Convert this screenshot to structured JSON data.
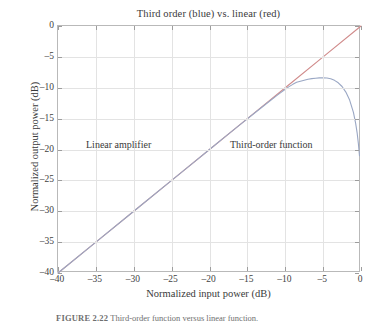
{
  "figure": {
    "caption_label": "FIGURE 2.22",
    "caption_text": "Third-order function versus linear function."
  },
  "chart_data": {
    "type": "line",
    "title": "Third order (blue) vs. linear (red)",
    "xlabel": "Normalized input power (dB)",
    "ylabel": "Normalized output power (dB)",
    "xlim": [
      -40,
      0
    ],
    "ylim": [
      -40,
      0
    ],
    "xticks": [
      -40,
      -35,
      -30,
      -25,
      -20,
      -15,
      -10,
      -5,
      0
    ],
    "yticks": [
      0,
      -5,
      -10,
      -15,
      -20,
      -25,
      -30,
      -35,
      -40
    ],
    "xticklabels": [
      "–40",
      "–35",
      "–30",
      "–25",
      "–20",
      "–15",
      "–10",
      "–5",
      "0"
    ],
    "yticklabels": [
      "0",
      "–5",
      "–10",
      "–15",
      "–20",
      "–25",
      "–30",
      "–35",
      "–40"
    ],
    "grid": true,
    "legend": "none",
    "annotations": [
      {
        "text": "Linear amplifier",
        "x": -32.0,
        "y": -18.5
      },
      {
        "text": "Third-order function",
        "x": -12.5,
        "y": -18.5
      }
    ],
    "series": [
      {
        "name": "linear (red)",
        "color": "#d08a8a",
        "x": [
          -40,
          -35,
          -30,
          -25,
          -20,
          -15,
          -10,
          -5,
          0
        ],
        "y": [
          -40,
          -35,
          -30,
          -25,
          -20,
          -15,
          -10,
          -5,
          0
        ]
      },
      {
        "name": "third order (blue)",
        "color": "#9aa7c4",
        "x": [
          -40,
          -35,
          -30,
          -25,
          -22,
          -20,
          -18,
          -16,
          -14,
          -12,
          -11,
          -10,
          -9.5,
          -9,
          -8.5,
          -8,
          -7.5,
          -7,
          -6.5,
          -6,
          -5.5,
          -5,
          -4.5,
          -4,
          -3.5,
          -3,
          -2.5,
          -2,
          -1.5,
          -1,
          -0.7,
          -0.5,
          -0.35,
          -0.2
        ],
        "y": [
          -40.0,
          -35.0,
          -30.0,
          -25.0,
          -22.0,
          -20.0,
          -18.0,
          -16.02,
          -14.05,
          -12.1,
          -11.15,
          -10.25,
          -9.82,
          -9.45,
          -9.12,
          -8.95,
          -8.78,
          -8.62,
          -8.52,
          -8.45,
          -8.4,
          -8.38,
          -8.42,
          -8.55,
          -8.8,
          -9.2,
          -9.8,
          -10.7,
          -12.0,
          -14.0,
          -15.8,
          -17.4,
          -19.0,
          -21.0
        ]
      }
    ]
  }
}
